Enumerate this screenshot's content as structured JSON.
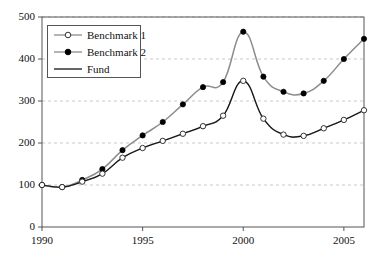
{
  "chart_data": {
    "type": "line",
    "title": "",
    "xlabel": "",
    "ylabel": "",
    "x": [
      1990,
      1991,
      1992,
      1993,
      1994,
      1995,
      1996,
      1997,
      1998,
      1999,
      2000,
      2001,
      2002,
      2003,
      2004,
      2005,
      2006
    ],
    "xlim": [
      1990,
      2006
    ],
    "ylim": [
      0,
      500
    ],
    "xticks": [
      1990,
      1995,
      2000,
      2005
    ],
    "xtick_labels": [
      "1990",
      "1995",
      "2000",
      "2005"
    ],
    "yticks": [
      0,
      100,
      200,
      300,
      400,
      500
    ],
    "ytick_labels": [
      "0",
      "100",
      "200",
      "300",
      "400",
      "500"
    ],
    "grid": "horizontal-dashed",
    "legend_position": "upper-left",
    "series": [
      {
        "name": "Benchmark 1",
        "marker": "open-circle",
        "color": "#8c8c8c",
        "marker_edge_color": "#333333",
        "marker_face_color": "#ffffff",
        "values": [
          100,
          95,
          108,
          127,
          165,
          188,
          205,
          222,
          240,
          265,
          348,
          258,
          220,
          217,
          235,
          255,
          278
        ]
      },
      {
        "name": "Benchmark 2",
        "marker": "filled-circle",
        "color": "#8c8c8c",
        "marker_edge_color": "#000000",
        "marker_face_color": "#000000",
        "values": [
          100,
          95,
          112,
          138,
          183,
          218,
          250,
          292,
          333,
          345,
          465,
          358,
          322,
          318,
          348,
          400,
          448
        ]
      },
      {
        "name": "Fund",
        "marker": "none",
        "color": "#111111",
        "values": [
          100,
          95,
          108,
          127,
          165,
          188,
          205,
          222,
          240,
          265,
          348,
          258,
          220,
          217,
          235,
          255,
          278
        ]
      }
    ]
  },
  "legend": {
    "entries": [
      {
        "label": "Benchmark 1",
        "symbol": "line-open-circle"
      },
      {
        "label": "Benchmark 2",
        "symbol": "line-filled-circle"
      },
      {
        "label": "Fund",
        "symbol": "plain-line"
      }
    ]
  },
  "colors": {
    "benchmark_line": "#8c8c8c",
    "fund_line": "#111111",
    "axis": "#555555",
    "grid": "#bbbbbb",
    "text": "#111111",
    "background": "#ffffff"
  }
}
